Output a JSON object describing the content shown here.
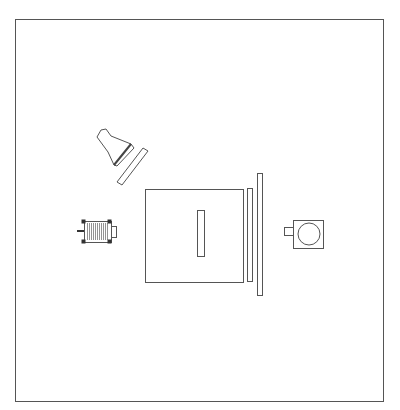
{
  "diagram": {
    "type": "schematic-layout",
    "canvas": {
      "width": 400,
      "height": 410
    },
    "stroke_color": "#555555",
    "frame": {
      "x": 15,
      "y": 19,
      "width": 368,
      "height": 382
    },
    "components": {
      "lamp": {
        "label": "lamp-light-source",
        "points": "97,137 101,130 106,129 111,136 131,144 134,148 117,166 114,165 108,152"
      },
      "angled_panel": {
        "label": "diffuser-panel",
        "points": "143,148 148,151 122,185 117,182"
      },
      "motor": {
        "label": "motor",
        "shaft": {
          "x1": 77,
          "y1": 231,
          "x2": 84,
          "y2": 231
        },
        "body": {
          "x": 84,
          "y": 221,
          "width": 27,
          "height": 21
        },
        "end_cap": {
          "x": 111,
          "y": 226,
          "width": 5,
          "height": 11
        },
        "coil_start": 87,
        "coil_end": 108,
        "coil_step": 2
      },
      "main_box": {
        "label": "main-enclosure",
        "x": 145,
        "y": 189,
        "width": 98,
        "height": 93
      },
      "slot": {
        "label": "inner-slot",
        "x": 197,
        "y": 210,
        "width": 7,
        "height": 46
      },
      "inner_strip": {
        "label": "inner-screen-strip",
        "x": 247,
        "y": 188,
        "width": 5,
        "height": 93
      },
      "tall_bar": {
        "label": "outer-screen-bar",
        "x": 257,
        "y": 173,
        "width": 5,
        "height": 122
      },
      "camera": {
        "label": "camera",
        "box": {
          "x": 293,
          "y": 220,
          "width": 30,
          "height": 28
        },
        "lens": {
          "cx": 309,
          "cy": 234,
          "r": 11
        },
        "nub": {
          "x": 284,
          "y": 227,
          "width": 9,
          "height": 8
        }
      }
    }
  }
}
